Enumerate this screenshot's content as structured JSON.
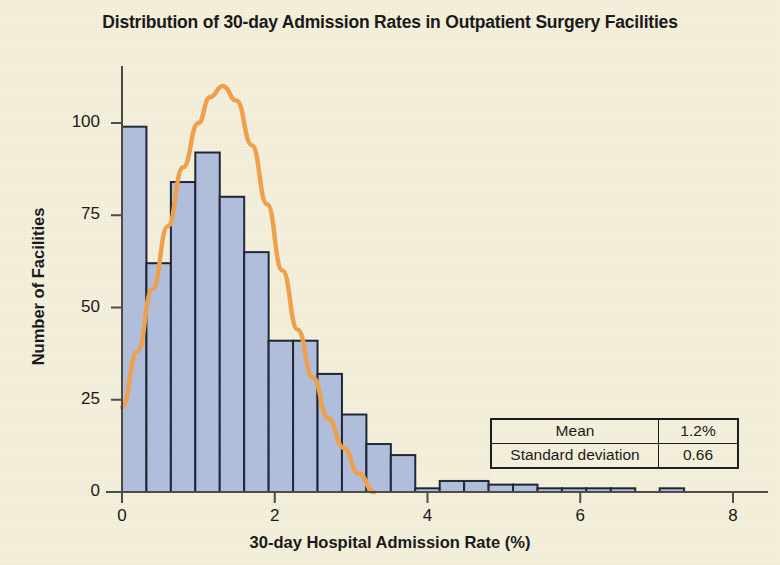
{
  "chart_data": {
    "type": "bar",
    "title": "Distribution of 30-day Admission Rates in Outpatient Surgery Facilities",
    "xlabel": "30-day Hospital Admission Rate (%)",
    "ylabel": "Number of Facilities",
    "xlim": [
      0,
      8
    ],
    "ylim": [
      0,
      115
    ],
    "xticks": [
      0,
      2,
      4,
      6,
      8
    ],
    "xtick_labels": [
      "0",
      "2",
      "4",
      "6",
      "8"
    ],
    "yticks": [
      0,
      25,
      50,
      75,
      100
    ],
    "ytick_labels": [
      "0",
      "25",
      "50",
      "75",
      "100"
    ],
    "grid": false,
    "legend": "none",
    "bin_width": 0.32,
    "bar_color": "#b0bede",
    "bar_edge_color": "#1b2436",
    "curve_color": "#f0a04b",
    "background_color": "#f4f0dc",
    "bins": [
      {
        "x0": 0.0,
        "x1": 0.32,
        "count": 99
      },
      {
        "x0": 0.32,
        "x1": 0.64,
        "count": 62
      },
      {
        "x0": 0.64,
        "x1": 0.96,
        "count": 84
      },
      {
        "x0": 0.96,
        "x1": 1.28,
        "count": 92
      },
      {
        "x0": 1.28,
        "x1": 1.6,
        "count": 80
      },
      {
        "x0": 1.6,
        "x1": 1.92,
        "count": 65
      },
      {
        "x0": 1.92,
        "x1": 2.24,
        "count": 41
      },
      {
        "x0": 2.24,
        "x1": 2.56,
        "count": 41
      },
      {
        "x0": 2.56,
        "x1": 2.88,
        "count": 32
      },
      {
        "x0": 2.88,
        "x1": 3.2,
        "count": 21
      },
      {
        "x0": 3.2,
        "x1": 3.52,
        "count": 13
      },
      {
        "x0": 3.52,
        "x1": 3.84,
        "count": 10
      },
      {
        "x0": 3.84,
        "x1": 4.16,
        "count": 1
      },
      {
        "x0": 4.16,
        "x1": 4.48,
        "count": 3
      },
      {
        "x0": 4.48,
        "x1": 4.8,
        "count": 3
      },
      {
        "x0": 4.8,
        "x1": 5.12,
        "count": 2
      },
      {
        "x0": 5.12,
        "x1": 5.44,
        "count": 2
      },
      {
        "x0": 5.44,
        "x1": 5.76,
        "count": 1
      },
      {
        "x0": 5.76,
        "x1": 6.08,
        "count": 1
      },
      {
        "x0": 6.08,
        "x1": 6.4,
        "count": 1
      },
      {
        "x0": 6.4,
        "x1": 6.72,
        "count": 1
      },
      {
        "x0": 7.04,
        "x1": 7.36,
        "count": 1
      }
    ],
    "overlay_curve": {
      "name": "normal-fit-curve",
      "type": "line",
      "color": "#f0a04b",
      "peak_x": 1.32,
      "peak_y": 110,
      "x_start": 0.0,
      "x_end": 3.3,
      "y_start": 23,
      "y_end": 0,
      "points": [
        {
          "x": 0.0,
          "y": 23
        },
        {
          "x": 0.2,
          "y": 38
        },
        {
          "x": 0.4,
          "y": 55
        },
        {
          "x": 0.6,
          "y": 72
        },
        {
          "x": 0.8,
          "y": 88
        },
        {
          "x": 1.0,
          "y": 100
        },
        {
          "x": 1.15,
          "y": 107
        },
        {
          "x": 1.32,
          "y": 110
        },
        {
          "x": 1.5,
          "y": 106
        },
        {
          "x": 1.7,
          "y": 94
        },
        {
          "x": 1.9,
          "y": 78
        },
        {
          "x": 2.1,
          "y": 60
        },
        {
          "x": 2.3,
          "y": 44
        },
        {
          "x": 2.5,
          "y": 31
        },
        {
          "x": 2.7,
          "y": 20
        },
        {
          "x": 2.9,
          "y": 12
        },
        {
          "x": 3.1,
          "y": 5
        },
        {
          "x": 3.3,
          "y": 0
        }
      ]
    },
    "stats_table": {
      "rows": [
        {
          "label": "Mean",
          "value": "1.2%"
        },
        {
          "label": "Standard deviation",
          "value": "0.66"
        }
      ]
    }
  }
}
